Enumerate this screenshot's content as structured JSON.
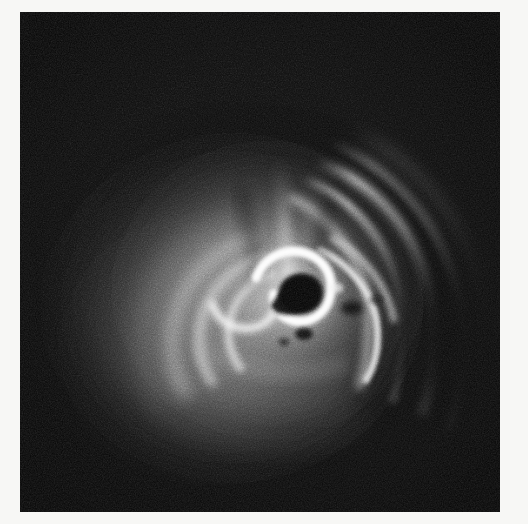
{
  "image": {
    "kind": "grayscale-astronomical-plate",
    "description": "Grainy monochrome astronomical image of a compact bright hook-shaped core with a dark crescent cavity, a vertical jet plume rising above it, concentric bright arcs fanning toward the right, and a broad diffuse halo toward the lower left.",
    "colorspace": "grayscale",
    "has_text_labels": false,
    "has_axes": false,
    "has_colorbar": false
  },
  "canvas": {
    "width": 528,
    "height": 524,
    "background_color": "#f7f7f5",
    "border_color": "#ffffff"
  },
  "plate": {
    "x": 20,
    "y": 12,
    "width": 480,
    "height": 500,
    "background_color": "#070707",
    "darkest_color": "#000000",
    "brightest_color": "#fdfdfd",
    "midtone_color": "#8a8a8a"
  },
  "grain": {
    "type": "film-grain-noise",
    "base_frequency": 0.85,
    "octaves": 3,
    "opacity": 0.55,
    "visible": true
  },
  "features": [
    {
      "id": "core-hook",
      "label": "bright hook-shaped core filament",
      "center_x": 278,
      "center_y": 284,
      "brightness": "#fcfcfc"
    },
    {
      "id": "core-cavity",
      "label": "dark crescent cavity inside core",
      "center_x": 276,
      "center_y": 287,
      "brightness": "#050505"
    },
    {
      "id": "jet-plume",
      "label": "vertical jet plume above core",
      "center_x": 262,
      "center_y": 205,
      "brightness": "#c8c8c8"
    },
    {
      "id": "right-arcs",
      "label": "concentric bright arcs fanning right",
      "center_x": 390,
      "center_y": 250,
      "brightness": "#b4b4b4"
    },
    {
      "id": "left-arcs",
      "label": "curved arcs wrapping left of core",
      "center_x": 195,
      "center_y": 295,
      "brightness": "#a0a0a0"
    },
    {
      "id": "diffuse-halo",
      "label": "broad diffuse halo toward lower left",
      "center_x": 250,
      "center_y": 330,
      "brightness": "#6e6e6e"
    },
    {
      "id": "dark-knots",
      "label": "small dark knots below core",
      "center_x": 290,
      "center_y": 322,
      "brightness": "#0c0c0c"
    }
  ]
}
